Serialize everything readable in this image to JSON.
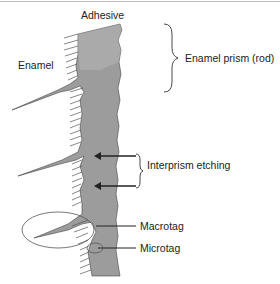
{
  "labels": {
    "adhesive": "Adhesive",
    "enamel": "Enamel",
    "enamel_prism": "Enamel prism (rod)",
    "interprism_etching": "Interprism etching",
    "macrotag": "Macrotag",
    "microtag": "Microtag"
  },
  "colors": {
    "adhesive_fill": "#9a9a9a",
    "adhesive_light": "#b4b4b4",
    "line": "#333333",
    "ellipse": "#555555"
  }
}
